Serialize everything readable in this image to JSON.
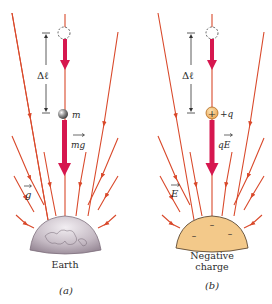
{
  "figure": {
    "panels": [
      {
        "id": "a",
        "caption": "(a)",
        "source_label": "Earth",
        "displacement_label": "Δℓ",
        "particle_label": "m",
        "force_label": "mg",
        "field_label": "g",
        "source_color": "#b9adb8",
        "particle_style": "gray-sphere"
      },
      {
        "id": "b",
        "caption": "(b)",
        "source_label_line1": "Negative",
        "source_label_line2": "charge",
        "displacement_label": "Δℓ",
        "particle_label": "+q",
        "particle_symbol": "+",
        "force_label": "qE",
        "field_label": "E",
        "source_color": "#f3c98a",
        "source_charge_signs": [
          "–",
          "–",
          "–"
        ],
        "particle_style": "orange-positive-charge"
      }
    ],
    "colors": {
      "field_line": "#d9492b",
      "force_arrow": "#d6174f",
      "dimension_line": "#333333",
      "text": "#2b2b2b"
    }
  }
}
